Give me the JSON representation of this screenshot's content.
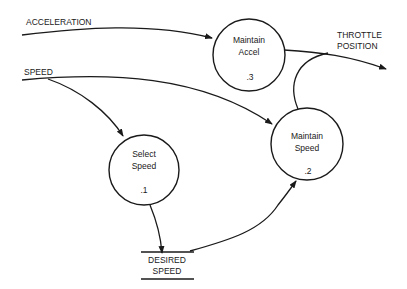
{
  "diagram": {
    "type": "data-flow-diagram",
    "processes": [
      {
        "id": "p1",
        "name_line1": "Select",
        "name_line2": "Speed",
        "number": ".1"
      },
      {
        "id": "p2",
        "name_line1": "Maintain",
        "name_line2": "Speed",
        "number": ".2"
      },
      {
        "id": "p3",
        "name_line1": "Maintain",
        "name_line2": "Accel",
        "number": ".3"
      }
    ],
    "data_store": {
      "line1": "DESIRED",
      "line2": "SPEED"
    },
    "flows": {
      "acceleration": "ACCELERATION",
      "speed": "SPEED",
      "throttle_line1": "THROTTLE",
      "throttle_line2": "POSITION"
    },
    "edges": [
      {
        "from": "ACCELERATION (external)",
        "to": "Maintain Accel .3"
      },
      {
        "from": "SPEED (external)",
        "to": "Select Speed .1"
      },
      {
        "from": "SPEED (external)",
        "to": "Maintain Speed .2"
      },
      {
        "from": "Select Speed .1",
        "to": "DESIRED SPEED"
      },
      {
        "from": "DESIRED SPEED",
        "to": "Maintain Speed .2"
      },
      {
        "from": "Maintain Accel .3",
        "to": "THROTTLE POSITION"
      },
      {
        "from": "Maintain Speed .2",
        "to": "THROTTLE POSITION"
      }
    ]
  }
}
